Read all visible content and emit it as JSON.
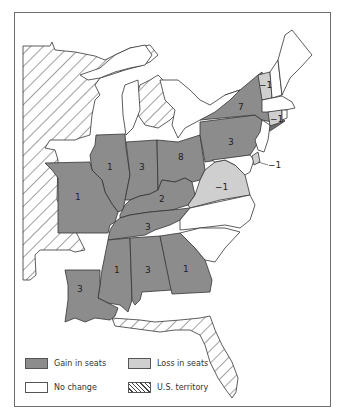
{
  "map": {
    "colors": {
      "gain": "#8c8c8c",
      "loss": "#cfcfcf",
      "no_change": "#ffffff",
      "territory_hatch": "#444444",
      "border": "#333333"
    },
    "states": [
      {
        "name": "New York",
        "change": "7",
        "status": "gain"
      },
      {
        "name": "Pennsylvania",
        "change": "3",
        "status": "gain"
      },
      {
        "name": "Ohio",
        "change": "8",
        "status": "gain"
      },
      {
        "name": "Indiana",
        "change": "3",
        "status": "gain"
      },
      {
        "name": "Illinois",
        "change": "1",
        "status": "gain"
      },
      {
        "name": "Missouri",
        "change": "1",
        "status": "gain"
      },
      {
        "name": "Kentucky",
        "change": "2",
        "status": "gain"
      },
      {
        "name": "Tennessee",
        "change": "3",
        "status": "gain"
      },
      {
        "name": "Mississippi",
        "change": "1",
        "status": "gain"
      },
      {
        "name": "Alabama",
        "change": "3",
        "status": "gain"
      },
      {
        "name": "Georgia",
        "change": "1",
        "status": "gain"
      },
      {
        "name": "Louisiana",
        "change": "3",
        "status": "gain"
      },
      {
        "name": "New Jersey",
        "change": "",
        "status": "gain"
      },
      {
        "name": "Vermont",
        "change": "-1",
        "status": "loss"
      },
      {
        "name": "Connecticut",
        "change": "-1",
        "status": "loss"
      },
      {
        "name": "Virginia",
        "change": "-1",
        "status": "loss"
      },
      {
        "name": "Delaware",
        "change": "-1",
        "status": "loss"
      },
      {
        "name": "Maine",
        "change": "",
        "status": "no_change"
      },
      {
        "name": "New Hampshire",
        "change": "",
        "status": "no_change"
      },
      {
        "name": "Massachusetts",
        "change": "",
        "status": "no_change"
      },
      {
        "name": "Rhode Island",
        "change": "",
        "status": "no_change"
      },
      {
        "name": "Maryland",
        "change": "",
        "status": "no_change"
      },
      {
        "name": "North Carolina",
        "change": "",
        "status": "no_change"
      },
      {
        "name": "South Carolina",
        "change": "",
        "status": "no_change"
      },
      {
        "name": "Michigan Territory",
        "change": "",
        "status": "territory"
      },
      {
        "name": "Unorganized Territory",
        "change": "",
        "status": "territory"
      },
      {
        "name": "Arkansas Territory",
        "change": "",
        "status": "territory"
      },
      {
        "name": "Florida Territory",
        "change": "",
        "status": "territory"
      }
    ],
    "labels": {
      "ny": "7",
      "pa": "3",
      "oh": "8",
      "in": "3",
      "il": "1",
      "mo": "1",
      "ky": "2",
      "tn": "3",
      "ms": "1",
      "al": "3",
      "ga": "1",
      "la": "3",
      "vt": "−1",
      "ct": "−1",
      "va": "−1",
      "de": "−1"
    }
  },
  "legend": {
    "gain": "Gain in seats",
    "loss": "Loss in seats",
    "no_change": "No change",
    "territory": "U.S. territory"
  }
}
